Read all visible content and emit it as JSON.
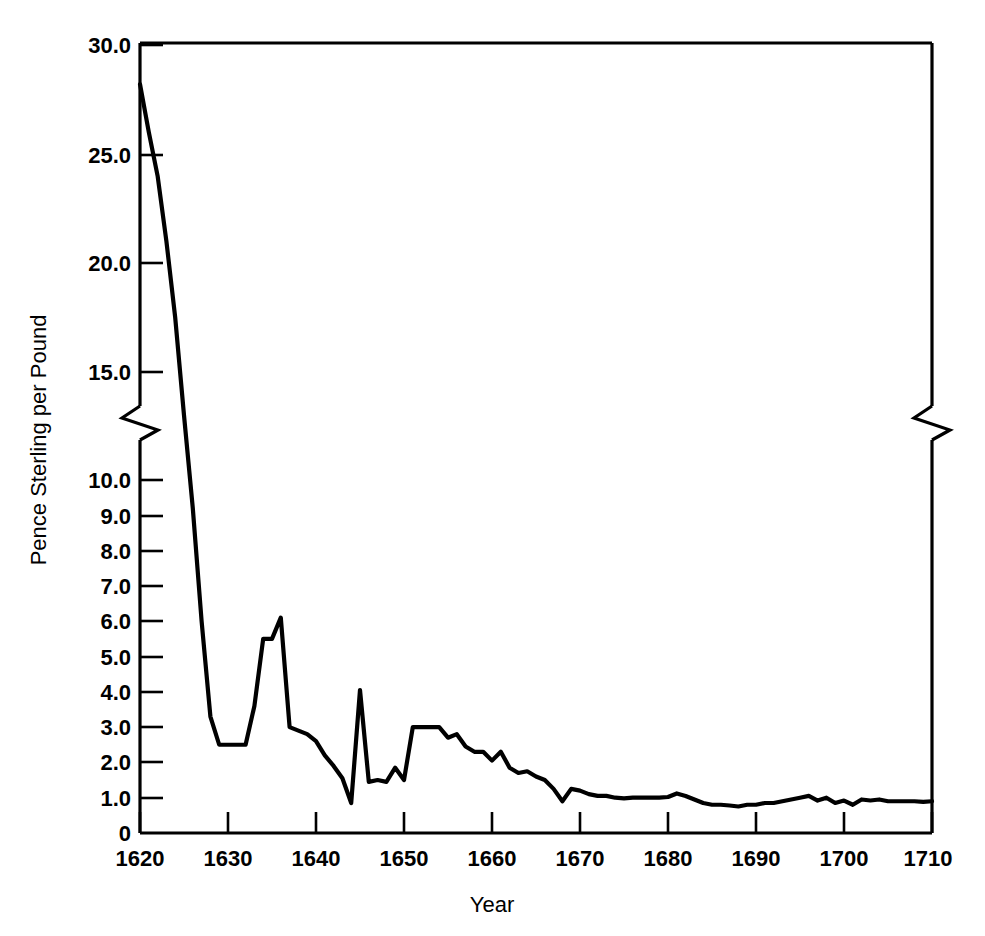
{
  "chart_data": {
    "type": "line",
    "title": "",
    "xlabel": "Year",
    "ylabel": "Pence Sterling per Pound",
    "xlim": [
      1620,
      1710
    ],
    "ylim": [
      0,
      30
    ],
    "grid": false,
    "legend": "none",
    "axis_break": {
      "present": true,
      "between": [
        10.0,
        15.0
      ],
      "note": "y-axis broken between 10.0 and 15.0; scale is expanded below 10.0"
    },
    "x_ticks": [
      1620,
      1630,
      1640,
      1650,
      1660,
      1670,
      1680,
      1690,
      1700,
      1710
    ],
    "x_tick_labels": [
      "1620",
      "1630",
      "1640",
      "1650",
      "1660",
      "1670",
      "1680",
      "1690",
      "1700",
      "1710"
    ],
    "y_ticks": [
      0,
      1.0,
      2.0,
      3.0,
      4.0,
      5.0,
      6.0,
      7.0,
      8.0,
      9.0,
      10.0,
      15.0,
      20.0,
      25.0,
      30.0
    ],
    "y_tick_labels": [
      "0",
      "1.0",
      "2.0",
      "3.0",
      "4.0",
      "5.0",
      "6.0",
      "7.0",
      "8.0",
      "9.0",
      "10.0",
      "15.0",
      "20.0",
      "25.0",
      "30.0"
    ],
    "series": [
      {
        "name": "Tobacco price",
        "color": "#000000",
        "x": [
          1620,
          1621,
          1622,
          1623,
          1624,
          1625,
          1626,
          1627,
          1628,
          1629,
          1630,
          1631,
          1632,
          1633,
          1634,
          1635,
          1636,
          1637,
          1638,
          1639,
          1640,
          1641,
          1642,
          1643,
          1644,
          1645,
          1646,
          1647,
          1648,
          1649,
          1650,
          1651,
          1652,
          1653,
          1654,
          1655,
          1656,
          1657,
          1658,
          1659,
          1660,
          1661,
          1662,
          1663,
          1664,
          1665,
          1666,
          1667,
          1668,
          1669,
          1670,
          1671,
          1672,
          1673,
          1674,
          1675,
          1676,
          1677,
          1678,
          1679,
          1680,
          1681,
          1682,
          1683,
          1684,
          1685,
          1686,
          1687,
          1688,
          1689,
          1690,
          1691,
          1692,
          1693,
          1694,
          1695,
          1696,
          1697,
          1698,
          1699,
          1700,
          1701,
          1702,
          1703,
          1704,
          1705,
          1706,
          1707,
          1708,
          1709,
          1710
        ],
        "y": [
          28.2,
          26.0,
          24.0,
          21.0,
          17.5,
          13.0,
          9.2,
          6.0,
          3.3,
          2.5,
          2.5,
          2.5,
          2.5,
          3.6,
          5.5,
          5.5,
          6.1,
          3.0,
          2.9,
          2.8,
          2.6,
          2.2,
          1.9,
          1.55,
          0.85,
          4.05,
          1.45,
          1.5,
          1.45,
          1.85,
          1.5,
          3.0,
          3.0,
          3.0,
          3.0,
          2.7,
          2.8,
          2.45,
          2.3,
          2.3,
          2.05,
          2.3,
          1.85,
          1.7,
          1.75,
          1.6,
          1.5,
          1.25,
          0.9,
          1.25,
          1.2,
          1.1,
          1.05,
          1.05,
          1.0,
          0.98,
          1.0,
          1.0,
          1.0,
          1.0,
          1.02,
          1.12,
          1.05,
          0.95,
          0.85,
          0.8,
          0.8,
          0.78,
          0.75,
          0.8,
          0.8,
          0.85,
          0.85,
          0.9,
          0.95,
          1.0,
          1.05,
          0.92,
          1.0,
          0.85,
          0.92,
          0.8,
          0.95,
          0.92,
          0.95,
          0.9,
          0.9,
          0.9,
          0.9,
          0.88,
          0.9
        ]
      }
    ]
  },
  "axes": {
    "y_title": "Pence Sterling per Pound",
    "x_title": "Year"
  }
}
